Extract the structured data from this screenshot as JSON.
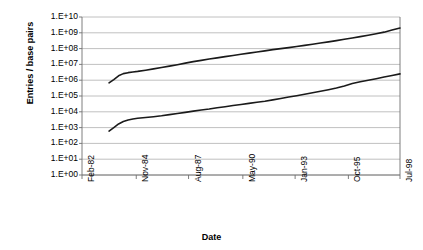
{
  "chart_data": {
    "type": "line",
    "title": "",
    "xlabel": "Date",
    "ylabel": "Entries / base pairs",
    "yscale": "log",
    "ylim": [
      1,
      10000000000
    ],
    "grid": true,
    "legend": "none",
    "y_tick_labels": [
      "1.E+10",
      "1.E+09",
      "1.E+08",
      "1.E+07",
      "1.E+06",
      "1.E+05",
      "1.E+04",
      "1.E+03",
      "1.E+02",
      "1.E+01",
      "1.E+00"
    ],
    "y_tick_values": [
      10000000000.0,
      1000000000.0,
      100000000.0,
      10000000.0,
      1000000.0,
      100000.0,
      10000.0,
      1000.0,
      100.0,
      10.0,
      1.0
    ],
    "x_tick_labels": [
      "Feb-82",
      "Nov-84",
      "Aug-87",
      "May-90",
      "Jan-93",
      "Oct-95",
      "Jul-98"
    ],
    "x_tick_fractions": [
      0.0,
      0.1706,
      0.3351,
      0.5058,
      0.6702,
      0.8377,
      1.0
    ],
    "series": [
      {
        "name": "base pairs",
        "color": "#1a1a1a",
        "x": [
          0.085,
          0.1,
          0.115,
          0.13,
          0.145,
          0.16,
          0.175,
          0.2,
          0.225,
          0.25,
          0.275,
          0.3,
          0.325,
          0.35,
          0.375,
          0.4,
          0.425,
          0.45,
          0.475,
          0.5,
          0.525,
          0.55,
          0.575,
          0.6,
          0.625,
          0.65,
          0.675,
          0.7,
          0.725,
          0.75,
          0.775,
          0.8,
          0.825,
          0.85,
          0.875,
          0.9,
          0.925,
          0.95,
          0.975,
          1.0
        ],
        "y": [
          680000,
          1100000,
          1900000,
          2600000,
          3000000,
          3300000,
          3600000,
          4300000,
          5200000,
          6300000,
          7800000,
          9600000,
          12000000,
          15000000,
          18000000,
          22000000,
          26000000,
          31000000,
          37000000,
          44000000,
          52000000,
          61000000,
          72000000,
          86000000,
          100000000,
          115000000,
          135000000,
          160000000,
          190000000,
          225000000,
          265000000,
          320000000,
          390000000,
          470000000,
          570000000,
          700000000,
          880000000,
          1100000000,
          1500000000,
          2000000000
        ]
      },
      {
        "name": "entries",
        "color": "#1a1a1a",
        "x": [
          0.085,
          0.1,
          0.115,
          0.13,
          0.145,
          0.16,
          0.175,
          0.2,
          0.225,
          0.25,
          0.275,
          0.3,
          0.325,
          0.35,
          0.375,
          0.4,
          0.425,
          0.45,
          0.475,
          0.5,
          0.525,
          0.55,
          0.575,
          0.6,
          0.625,
          0.65,
          0.675,
          0.7,
          0.725,
          0.75,
          0.775,
          0.8,
          0.825,
          0.85,
          0.875,
          0.9,
          0.925,
          0.95,
          0.975,
          1.0
        ],
        "y": [
          600,
          1000,
          1700,
          2400,
          3000,
          3500,
          3900,
          4400,
          4900,
          5600,
          6600,
          7800,
          9200,
          11000,
          13000,
          15000,
          18000,
          21000,
          25000,
          29000,
          34000,
          40000,
          47000,
          57000,
          70000,
          86000,
          105000,
          130000,
          160000,
          200000,
          250000,
          320000,
          430000,
          620000,
          800000,
          1000000,
          1250000,
          1600000,
          2000000,
          2500000
        ]
      }
    ]
  },
  "axes": {
    "ylabel_text": "Entries / base pairs",
    "xlabel_text": "Date"
  }
}
